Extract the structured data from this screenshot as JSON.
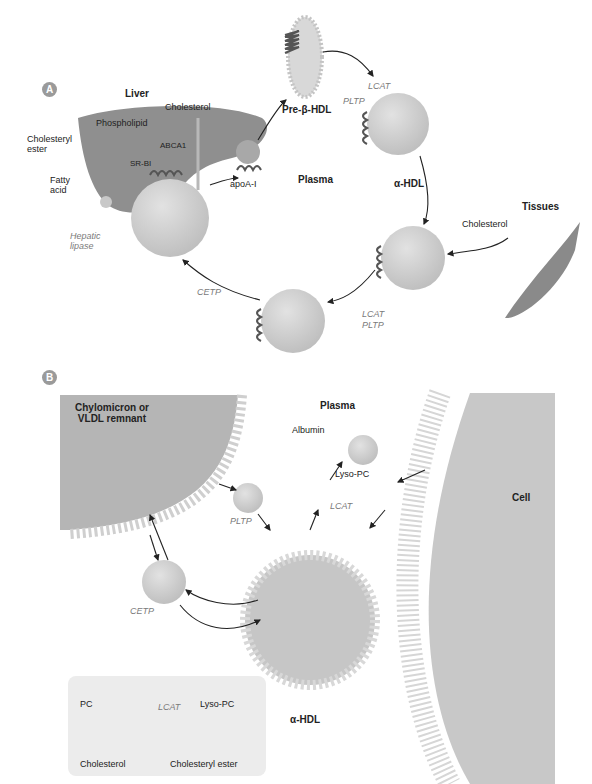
{
  "panels": {
    "a": "A",
    "b": "B"
  },
  "panel_a": {
    "liver": "Liver",
    "cholesterol": "Cholesterol",
    "phospholipid": "Phospholipid",
    "cholesteryl_ester": "Cholesteryl\nester",
    "abca1": "ABCA1",
    "sr_bi": "SR-BI",
    "fatty_acid": "Fatty\nacid",
    "apoa1": "apoA-I",
    "hepatic_lipase": "Hepatic\nlipase",
    "pre_beta_hdl": "Pre-β-HDL",
    "lcat": "LCAT",
    "pltp": "PLTP",
    "alpha_hdl": "α-HDL",
    "plasma": "Plasma",
    "tissues": "Tissues",
    "tissue_cholesterol": "Cholesterol",
    "cetp": "CETP",
    "lcat2": "LCAT",
    "pltp2": "PLTP"
  },
  "panel_b": {
    "chylomicron": "Chylomicron or\nVLDL remnant",
    "plasma": "Plasma",
    "albumin": "Albumin",
    "lyso_pc": "Lyso-PC",
    "lcat": "LCAT",
    "pltp": "PLTP",
    "cetp": "CETP",
    "cell": "Cell",
    "alpha_hdl": "α-HDL"
  },
  "reaction_box": {
    "pc": "PC",
    "lcat": "LCAT",
    "lyso_pc": "Lyso-PC",
    "cholesterol": "Cholesterol",
    "cholesteryl_ester": "Cholesteryl ester"
  },
  "colors": {
    "liver": "#8f8f8f",
    "particle": "#d0d0d0",
    "apo": "#555555",
    "arrow": "#222222"
  }
}
